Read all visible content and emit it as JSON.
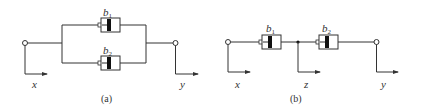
{
  "figure": {
    "panel_a": {
      "caption": "(a)",
      "arrangement": "parallel",
      "dampers": [
        {
          "base": "b",
          "sub": "1"
        },
        {
          "base": "b",
          "sub": "2"
        }
      ],
      "input_label": "x",
      "output_label": "y"
    },
    "panel_b": {
      "caption": "(b)",
      "arrangement": "series",
      "dampers": [
        {
          "base": "b",
          "sub": "1"
        },
        {
          "base": "b",
          "sub": "2"
        }
      ],
      "input_label": "x",
      "middle_label": "z",
      "output_label": "y"
    }
  },
  "colors": {
    "line": "#333333",
    "piston": "#111111",
    "background": "#ffffff"
  }
}
